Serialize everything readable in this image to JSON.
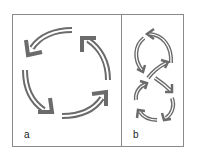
{
  "figure": {
    "panels": [
      {
        "label": "a",
        "description": "Four curved arrows arranged in a circle (cycle)"
      },
      {
        "label": "b",
        "description": "Curved arrows arranged in a figure-eight loop"
      }
    ],
    "colors": {
      "arrow": "#6b6b6b",
      "border": "#8a8a8a",
      "background": "#ffffff"
    }
  }
}
